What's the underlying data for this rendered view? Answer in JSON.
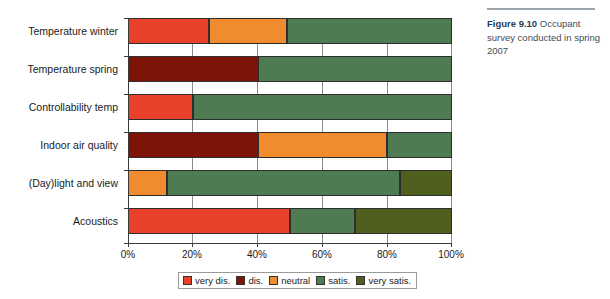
{
  "caption": {
    "figure_number": "Figure 9.10",
    "text": " Occupant survey conducted in spring 2007"
  },
  "legend": {
    "position": "bottom",
    "items": [
      {
        "label": "very dis.",
        "color": "#E8412A"
      },
      {
        "label": "dis.",
        "color": "#7E1408"
      },
      {
        "label": "neutral",
        "color": "#F08C2E"
      },
      {
        "label": "satis.",
        "color": "#4E7B52"
      },
      {
        "label": "very satis.",
        "color": "#4E5F1E"
      }
    ]
  },
  "axis": {
    "x_ticks": [
      "0%",
      "20%",
      "40%",
      "60%",
      "80%",
      "100%"
    ]
  },
  "chart_data": {
    "type": "bar",
    "orientation": "horizontal",
    "stacked": true,
    "normalized_percent": true,
    "title": "",
    "xlabel": "",
    "ylabel": "",
    "xlim": [
      0,
      100
    ],
    "xticks": [
      0,
      20,
      40,
      60,
      80,
      100
    ],
    "xticklabels": [
      "0%",
      "20%",
      "40%",
      "60%",
      "80%",
      "100%"
    ],
    "grid": true,
    "legend_position": "bottom",
    "categories": [
      "Temperature winter",
      "Temperature spring",
      "Controllability temp",
      "Indoor air quality",
      "(Day)light and view",
      "Acoustics"
    ],
    "series": [
      {
        "name": "very dis.",
        "color": "#E8412A",
        "values": [
          25,
          0,
          20,
          0,
          0,
          50
        ]
      },
      {
        "name": "dis.",
        "color": "#7E1408",
        "values": [
          0,
          40,
          0,
          40,
          0,
          0
        ]
      },
      {
        "name": "neutral",
        "color": "#F08C2E",
        "values": [
          24,
          0,
          0,
          40,
          12,
          0
        ]
      },
      {
        "name": "satis.",
        "color": "#4E7B52",
        "values": [
          51,
          60,
          80,
          20,
          72,
          20
        ]
      },
      {
        "name": "very satis.",
        "color": "#4E5F1E",
        "values": [
          0,
          0,
          0,
          0,
          16,
          30
        ]
      }
    ]
  }
}
